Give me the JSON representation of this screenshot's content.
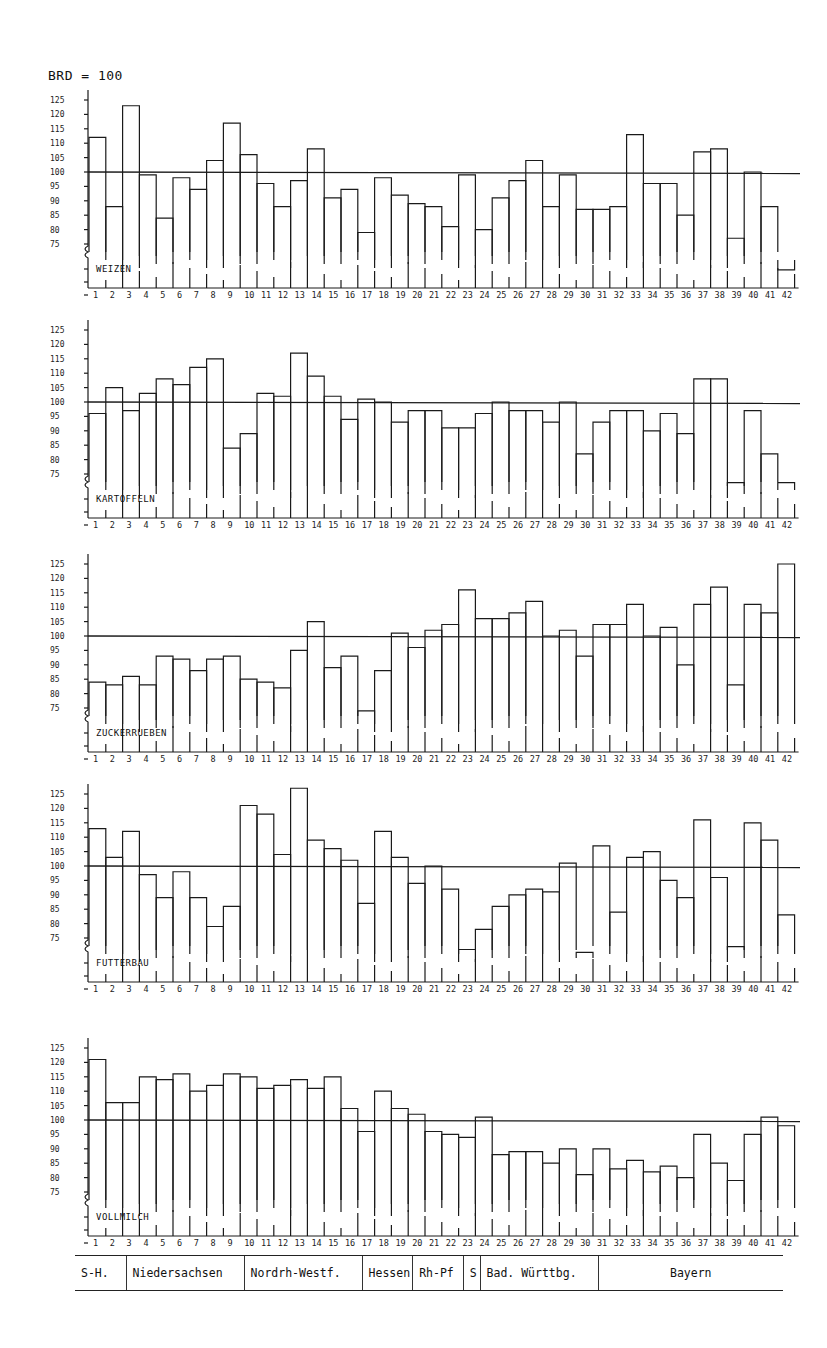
{
  "title": "BRD = 100",
  "y_tick_labels": [
    "125",
    "120",
    "115",
    "110",
    "105",
    "100",
    "95",
    "90",
    "85",
    "80",
    "75"
  ],
  "x_labels": [
    "1",
    "2",
    "3",
    "4",
    "5",
    "6",
    "7",
    "8",
    "9",
    "10",
    "11",
    "12",
    "13",
    "14",
    "15",
    "16",
    "17",
    "18",
    "19",
    "20",
    "21",
    "22",
    "23",
    "24",
    "25",
    "26",
    "27",
    "28",
    "29",
    "30",
    "31",
    "32",
    "33",
    "34",
    "35",
    "36",
    "37",
    "38",
    "39",
    "40",
    "41",
    "42"
  ],
  "regions": [
    {
      "label": "S-H.",
      "from": 1,
      "to": 3
    },
    {
      "label": "Niedersachsen",
      "from": 4,
      "to": 10
    },
    {
      "label": "Nordrh-Westf.",
      "from": 11,
      "to": 17
    },
    {
      "label": "Hessen",
      "from": 18,
      "to": 20
    },
    {
      "label": "Rh-Pf",
      "from": 21,
      "to": 23
    },
    {
      "label": "S",
      "from": 24,
      "to": 24
    },
    {
      "label": "Bad. Württbg.",
      "from": 25,
      "to": 31
    },
    {
      "label": "Bayern",
      "from": 32,
      "to": 42
    }
  ],
  "colors": {
    "line": "#1a1a1a",
    "background": "#ffffff"
  },
  "chart_data": [
    {
      "type": "bar",
      "title": "WEIZEN",
      "subtitle": "BRD = 100",
      "xlabel": "",
      "ylabel": "Index (BRD = 100)",
      "ylim": [
        75,
        125
      ],
      "reference_line": 100,
      "categories": [
        "1",
        "2",
        "3",
        "4",
        "5",
        "6",
        "7",
        "8",
        "9",
        "10",
        "11",
        "12",
        "13",
        "14",
        "15",
        "16",
        "17",
        "18",
        "19",
        "20",
        "21",
        "22",
        "23",
        "24",
        "25",
        "26",
        "27",
        "28",
        "29",
        "30",
        "31",
        "32",
        "33",
        "34",
        "35",
        "36",
        "37",
        "38",
        "39",
        "40",
        "41",
        "42"
      ],
      "values": [
        112,
        88,
        123,
        99,
        84,
        98,
        94,
        104,
        117,
        106,
        96,
        88,
        97,
        108,
        91,
        94,
        79,
        98,
        92,
        89,
        88,
        81,
        99,
        80,
        91,
        97,
        104,
        88,
        99,
        87,
        87,
        88,
        113,
        96,
        96,
        85,
        107,
        108,
        77,
        100,
        88,
        66
      ]
    },
    {
      "type": "bar",
      "title": "KARTOFFELN",
      "xlabel": "",
      "ylabel": "Index (BRD = 100)",
      "ylim": [
        75,
        125
      ],
      "reference_line": 100,
      "categories": [
        "1",
        "2",
        "3",
        "4",
        "5",
        "6",
        "7",
        "8",
        "9",
        "10",
        "11",
        "12",
        "13",
        "14",
        "15",
        "16",
        "17",
        "18",
        "19",
        "20",
        "21",
        "22",
        "23",
        "24",
        "25",
        "26",
        "27",
        "28",
        "29",
        "30",
        "31",
        "32",
        "33",
        "34",
        "35",
        "36",
        "37",
        "38",
        "39",
        "40",
        "41",
        "42"
      ],
      "values": [
        96,
        105,
        97,
        103,
        108,
        106,
        112,
        115,
        84,
        89,
        103,
        102,
        117,
        109,
        102,
        94,
        101,
        100,
        93,
        97,
        97,
        91,
        91,
        96,
        100,
        97,
        97,
        93,
        100,
        82,
        93,
        97,
        97,
        90,
        96,
        89,
        108,
        108,
        72,
        97,
        82,
        72
      ]
    },
    {
      "type": "bar",
      "title": "ZUCKERRUEBEN",
      "xlabel": "",
      "ylabel": "Index (BRD = 100)",
      "ylim": [
        75,
        125
      ],
      "reference_line": 100,
      "categories": [
        "1",
        "2",
        "3",
        "4",
        "5",
        "6",
        "7",
        "8",
        "9",
        "10",
        "11",
        "12",
        "13",
        "14",
        "15",
        "16",
        "17",
        "18",
        "19",
        "20",
        "21",
        "22",
        "23",
        "24",
        "25",
        "26",
        "27",
        "28",
        "29",
        "30",
        "31",
        "32",
        "33",
        "34",
        "35",
        "36",
        "37",
        "38",
        "39",
        "40",
        "41",
        "42"
      ],
      "values": [
        84,
        83,
        86,
        83,
        93,
        92,
        88,
        92,
        93,
        85,
        84,
        82,
        95,
        105,
        89,
        93,
        74,
        88,
        101,
        96,
        102,
        104,
        116,
        106,
        106,
        108,
        112,
        100,
        102,
        93,
        104,
        104,
        111,
        100,
        103,
        90,
        111,
        117,
        83,
        111,
        108,
        125
      ]
    },
    {
      "type": "bar",
      "title": "FUTTERBAU",
      "xlabel": "",
      "ylabel": "Index (BRD = 100)",
      "ylim": [
        75,
        125
      ],
      "reference_line": 100,
      "categories": [
        "1",
        "2",
        "3",
        "4",
        "5",
        "6",
        "7",
        "8",
        "9",
        "10",
        "11",
        "12",
        "13",
        "14",
        "15",
        "16",
        "17",
        "18",
        "19",
        "20",
        "21",
        "22",
        "23",
        "24",
        "25",
        "26",
        "27",
        "28",
        "29",
        "30",
        "31",
        "32",
        "33",
        "34",
        "35",
        "36",
        "37",
        "38",
        "39",
        "40",
        "41",
        "42"
      ],
      "values": [
        113,
        103,
        112,
        97,
        89,
        98,
        89,
        79,
        86,
        121,
        118,
        104,
        127,
        109,
        106,
        102,
        87,
        112,
        103,
        94,
        100,
        92,
        71,
        78,
        86,
        90,
        92,
        91,
        101,
        70,
        107,
        84,
        103,
        105,
        95,
        89,
        116,
        96,
        72,
        115,
        109,
        83
      ]
    },
    {
      "type": "bar",
      "title": "VOLLMILCH",
      "xlabel": "",
      "ylabel": "Index (BRD = 100)",
      "ylim": [
        75,
        125
      ],
      "reference_line": 100,
      "categories": [
        "1",
        "2",
        "3",
        "4",
        "5",
        "6",
        "7",
        "8",
        "9",
        "10",
        "11",
        "12",
        "13",
        "14",
        "15",
        "16",
        "17",
        "18",
        "19",
        "20",
        "21",
        "22",
        "23",
        "24",
        "25",
        "26",
        "27",
        "28",
        "29",
        "30",
        "31",
        "32",
        "33",
        "34",
        "35",
        "36",
        "37",
        "38",
        "39",
        "40",
        "41",
        "42"
      ],
      "values": [
        121,
        106,
        106,
        115,
        114,
        116,
        110,
        112,
        116,
        115,
        111,
        112,
        114,
        111,
        115,
        104,
        96,
        110,
        104,
        102,
        96,
        95,
        94,
        101,
        88,
        89,
        89,
        85,
        90,
        81,
        90,
        83,
        86,
        82,
        84,
        80,
        95,
        85,
        79,
        95,
        101,
        98
      ]
    }
  ]
}
